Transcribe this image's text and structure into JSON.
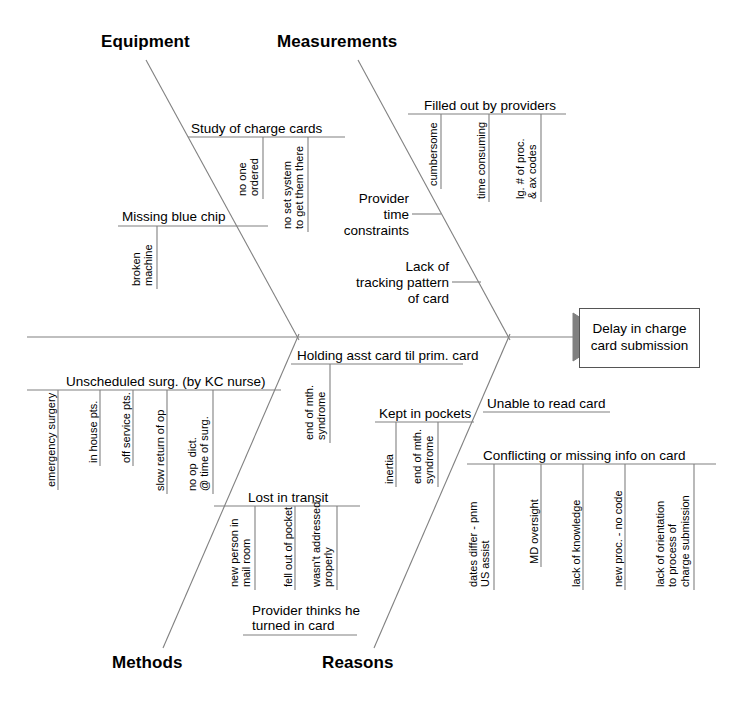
{
  "diagram": {
    "type": "fishbone-ishikawa",
    "effect": {
      "text": "Delay in charge\ncard submission"
    },
    "categories": [
      {
        "name": "Equipment",
        "position": "top-left"
      },
      {
        "name": "Measurements",
        "position": "top-right"
      },
      {
        "name": "Methods",
        "position": "bottom-left"
      },
      {
        "name": "Reasons",
        "position": "bottom-right"
      }
    ],
    "causes": {
      "equipment": [
        {
          "label": "Study of charge cards",
          "subcauses": [
            "no one\nordered",
            "no set system\nto get them there"
          ]
        },
        {
          "label": "Missing blue chip",
          "subcauses": [
            "broken\nmachine"
          ]
        }
      ],
      "measurements": [
        {
          "label": "Filled out by providers",
          "subcauses": [
            "cumbersome",
            "time consuming",
            "lg. # of proc.\n& ax codes"
          ]
        }
      ],
      "measurements_spine": [
        {
          "label": "Provider\ntime\nconstraints"
        },
        {
          "label": "Lack of\ntracking pattern\nof card"
        }
      ],
      "methods": [
        {
          "label": "Unscheduled surg. (by KC nurse)",
          "subcauses": [
            "emergency surgery",
            "in house pts.",
            "off service pts.",
            "slow return of op",
            "no op  dict.\n@ time of surg."
          ]
        },
        {
          "label": "Lost in transit",
          "subcauses": [
            "new person in\nmail room",
            "fell out of pocket",
            "wasn't addressed\nproperly"
          ]
        },
        {
          "label": "Provider thinks he\nturned in card",
          "subcauses": []
        }
      ],
      "reasons": [
        {
          "label": "Holding asst card til prim. card",
          "subcauses": [
            "end of mth.\nsyndrome"
          ]
        },
        {
          "label": "Kept in pockets",
          "subcauses": [
            "inertia",
            "end of mth.\nsyndrome"
          ]
        },
        {
          "label": "Unable to read card",
          "subcauses": []
        },
        {
          "label": "Conflicting or missing info on card",
          "subcauses": [
            "dates differ - pnm\nUS assist",
            "MD oversight",
            "lack of knowledge",
            "new proc. - no code",
            "lack of orientation\nto process of\ncharge submission"
          ]
        }
      ]
    },
    "colors": {
      "line": "#808080",
      "text": "#000000",
      "arrowhead": "#808080",
      "box_border": "#555555",
      "background": "#ffffff"
    }
  }
}
